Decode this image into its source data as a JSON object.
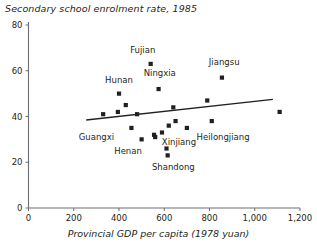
{
  "chart_data": {
    "type": "scatter",
    "title": "Secondary school enrolment rate, 1985",
    "xlabel": "Provincial GDP per capita (1978 yuan)",
    "ylabel": "",
    "xlim": [
      0,
      1200
    ],
    "ylim": [
      0,
      80
    ],
    "grid": false,
    "legend": false,
    "xticks": [
      "0",
      "200",
      "400",
      "600",
      "800",
      "1,000",
      "1,200"
    ],
    "xtick_values": [
      0,
      200,
      400,
      600,
      800,
      1000,
      1200
    ],
    "yticks": [
      "0",
      "20",
      "40",
      "60",
      "80"
    ],
    "ytick_values": [
      0,
      20,
      40,
      60,
      80
    ],
    "points": [
      {
        "x": 330,
        "y": 41,
        "label": ""
      },
      {
        "x": 395,
        "y": 42,
        "label": ""
      },
      {
        "x": 400,
        "y": 50,
        "label": ""
      },
      {
        "x": 430,
        "y": 45,
        "label": ""
      },
      {
        "x": 455,
        "y": 35,
        "label": ""
      },
      {
        "x": 480,
        "y": 41,
        "label": ""
      },
      {
        "x": 500,
        "y": 30,
        "label": ""
      },
      {
        "x": 540,
        "y": 63,
        "label": ""
      },
      {
        "x": 555,
        "y": 32,
        "label": ""
      },
      {
        "x": 560,
        "y": 31,
        "label": ""
      },
      {
        "x": 575,
        "y": 52,
        "label": ""
      },
      {
        "x": 590,
        "y": 33,
        "label": ""
      },
      {
        "x": 610,
        "y": 26,
        "label": ""
      },
      {
        "x": 615,
        "y": 23,
        "label": ""
      },
      {
        "x": 620,
        "y": 36,
        "label": ""
      },
      {
        "x": 640,
        "y": 44,
        "label": ""
      },
      {
        "x": 650,
        "y": 38,
        "label": ""
      },
      {
        "x": 700,
        "y": 35,
        "label": ""
      },
      {
        "x": 790,
        "y": 47,
        "label": ""
      },
      {
        "x": 810,
        "y": 38,
        "label": ""
      },
      {
        "x": 855,
        "y": 57,
        "label": ""
      },
      {
        "x": 1110,
        "y": 42,
        "label": ""
      }
    ],
    "annotations": [
      {
        "text": "Fujian",
        "x": 505,
        "y": 69
      },
      {
        "text": "Hunan",
        "x": 400,
        "y": 56
      },
      {
        "text": "Ningxia",
        "x": 580,
        "y": 59
      },
      {
        "text": "Jiangsu",
        "x": 865,
        "y": 64
      },
      {
        "text": "Guangxi",
        "x": 300,
        "y": 31
      },
      {
        "text": "Henan",
        "x": 440,
        "y": 25
      },
      {
        "text": "Shandong",
        "x": 640,
        "y": 18
      },
      {
        "text": "Xinjiang",
        "x": 665,
        "y": 29
      },
      {
        "text": "Heilongjiang",
        "x": 860,
        "y": 31
      }
    ],
    "trendline": {
      "x_start": 255,
      "y_start": 38.5,
      "x_end": 1080,
      "y_end": 47.5
    }
  },
  "colors": {
    "marker": "#231f20",
    "axis": "#6d6e71",
    "text": "#231f20",
    "trendline": "#231f20",
    "background": "#ffffff"
  }
}
